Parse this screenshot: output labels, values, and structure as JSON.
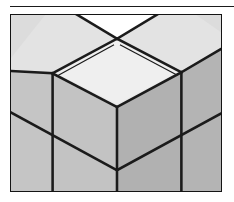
{
  "figure": {
    "frame": {
      "x": 10,
      "y": 14,
      "width": 212,
      "height": 178,
      "border_color": "#141414",
      "border_width": 1
    },
    "rule": {
      "x": 10,
      "y": 6,
      "width": 224,
      "color": "#1a1a1a"
    }
  },
  "palette": {
    "background": "#ffffff",
    "top_face": "#e9e9e9",
    "top_face_highlight": "#f2f2f2",
    "left_face": "#c2c2c2",
    "right_face": "#b0b0b0",
    "far_top_face": "#dcdcdc",
    "edge_line": "#1b1b1b",
    "notch_white": "#ffffff"
  },
  "geometry": {
    "projection": "isometric",
    "unit_half_width": 65,
    "unit_half_height": 34,
    "center_top_vertex": {
      "x": 107,
      "y": 24
    },
    "center_left_vertex": {
      "x": 42,
      "y": 59
    },
    "center_right_vertex": {
      "x": 172,
      "y": 58
    },
    "center_front_vertex": {
      "x": 107,
      "y": 93
    },
    "edge_stroke_width": 2.6
  },
  "faces": [
    {
      "name": "center-top-face",
      "shade": "top",
      "role": "top face of front corner cube"
    },
    {
      "name": "left-rear-top-face",
      "shade": "far-top",
      "role": "top face of cube behind-left"
    },
    {
      "name": "right-rear-top-face",
      "shade": "far-top",
      "role": "top face of cube behind-right"
    },
    {
      "name": "center-left-face",
      "shade": "left",
      "role": "left face of front corner cube"
    },
    {
      "name": "center-right-face",
      "shade": "right",
      "role": "right face of front corner cube"
    },
    {
      "name": "lower-left-face",
      "shade": "left",
      "role": "left face of cube below-left"
    },
    {
      "name": "lower-right-face",
      "shade": "right",
      "role": "right face of cube below-right"
    }
  ],
  "notch": {
    "name": "top-white-wedge",
    "role": "white background visible above the rear top faces at the top edge of the frame"
  }
}
